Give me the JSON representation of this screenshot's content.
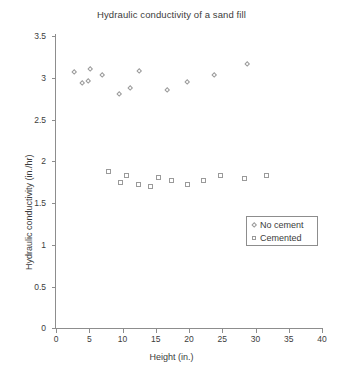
{
  "chart_data": {
    "type": "scatter",
    "title": "Hydraulic conductivity of a sand fill",
    "xlabel": "Height (in.)",
    "ylabel": "Hydraulic conductivity (in./hr)",
    "xlim": [
      0,
      40
    ],
    "ylim": [
      0,
      3.5
    ],
    "xticks": [
      0,
      5,
      10,
      15,
      20,
      25,
      30,
      35,
      40
    ],
    "yticks": [
      0,
      0.5,
      1,
      1.5,
      2,
      2.5,
      3,
      3.5
    ],
    "xtick_labels": [
      "0",
      "5",
      "10",
      "15",
      "20",
      "25",
      "30",
      "35",
      "40"
    ],
    "ytick_labels": [
      "0",
      "0.5",
      "1",
      "1.5",
      "2",
      "2.5",
      "3",
      "3.5"
    ],
    "grid": false,
    "legend_position": "lower-right",
    "series": [
      {
        "name": "No cement",
        "marker": "diamond",
        "color": "#9a9a9a",
        "points": [
          [
            2.9,
            3.06
          ],
          [
            4.1,
            2.93
          ],
          [
            4.9,
            2.95
          ],
          [
            5.3,
            3.09
          ],
          [
            7.0,
            3.02
          ],
          [
            9.6,
            2.79
          ],
          [
            11.3,
            2.86
          ],
          [
            12.6,
            3.07
          ],
          [
            16.8,
            2.84
          ],
          [
            19.9,
            2.94
          ],
          [
            23.9,
            3.02
          ],
          [
            28.9,
            3.15
          ]
        ]
      },
      {
        "name": "Cemented",
        "marker": "square",
        "color": "#9a9a9a",
        "points": [
          [
            7.9,
            1.87
          ],
          [
            9.7,
            1.74
          ],
          [
            10.6,
            1.82
          ],
          [
            12.5,
            1.72
          ],
          [
            14.3,
            1.69
          ],
          [
            15.5,
            1.8
          ],
          [
            17.5,
            1.77
          ],
          [
            19.9,
            1.72
          ],
          [
            22.2,
            1.76
          ],
          [
            24.8,
            1.83
          ],
          [
            28.4,
            1.79
          ],
          [
            31.7,
            1.82
          ]
        ]
      }
    ]
  },
  "legend": {
    "entries": [
      {
        "label": "No cement",
        "marker": "diamond-icon"
      },
      {
        "label": "Cemented",
        "marker": "square-icon"
      }
    ]
  }
}
